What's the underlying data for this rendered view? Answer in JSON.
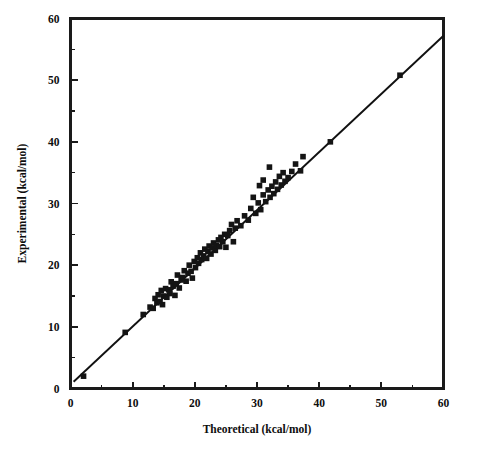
{
  "figure": {
    "background_color": "#ffffff",
    "foreground_color": "#111111",
    "width": 480,
    "height": 449
  },
  "axes": {
    "x_title": "Theoretical (kcal/mol)",
    "y_title": "Experimental (kcal/mol)",
    "x_ticks": [
      "0",
      "10",
      "20",
      "30",
      "40",
      "50",
      "60"
    ],
    "y_ticks": [
      "0",
      "10",
      "20",
      "30",
      "40",
      "50",
      "60"
    ],
    "x_tick_values": [
      0,
      10,
      20,
      30,
      40,
      50,
      60
    ],
    "y_tick_values": [
      0,
      10,
      20,
      30,
      40,
      50,
      60
    ],
    "x_minor_values": [
      5,
      15,
      25,
      35,
      45,
      55
    ],
    "y_minor_values": [
      5,
      15,
      25,
      35,
      45,
      55
    ]
  },
  "chart_data": {
    "type": "scatter",
    "title": "",
    "subtitle": "",
    "xlabel": "Theoretical (kcal/mol)",
    "ylabel": "Experimental (kcal/mol)",
    "xlim": [
      0,
      60
    ],
    "ylim": [
      0,
      60
    ],
    "grid": false,
    "legend": "none",
    "marker": {
      "shape": "square",
      "color": "#141414",
      "size_px": 5.6,
      "filled": true
    },
    "series": [
      {
        "name": "Theoretical vs Experimental",
        "points": [
          [
            2.1,
            2.0
          ],
          [
            8.8,
            9.1
          ],
          [
            11.7,
            12.0
          ],
          [
            12.8,
            13.2
          ],
          [
            13.3,
            13.0
          ],
          [
            13.6,
            14.6
          ],
          [
            13.9,
            13.9
          ],
          [
            14.1,
            15.2
          ],
          [
            14.4,
            14.1
          ],
          [
            14.6,
            15.9
          ],
          [
            14.8,
            13.6
          ],
          [
            15.0,
            15.0
          ],
          [
            15.3,
            16.2
          ],
          [
            15.5,
            14.8
          ],
          [
            15.8,
            16.0
          ],
          [
            16.0,
            15.4
          ],
          [
            16.2,
            17.3
          ],
          [
            16.5,
            16.6
          ],
          [
            16.8,
            15.1
          ],
          [
            17.0,
            17.0
          ],
          [
            17.2,
            18.4
          ],
          [
            17.5,
            16.3
          ],
          [
            17.8,
            17.6
          ],
          [
            18.0,
            18.0
          ],
          [
            18.3,
            19.1
          ],
          [
            18.6,
            17.4
          ],
          [
            18.9,
            18.7
          ],
          [
            19.1,
            20.0
          ],
          [
            19.4,
            19.0
          ],
          [
            19.6,
            17.9
          ],
          [
            19.9,
            20.6
          ],
          [
            20.1,
            19.6
          ],
          [
            20.4,
            21.2
          ],
          [
            20.6,
            20.3
          ],
          [
            20.9,
            22.0
          ],
          [
            21.1,
            20.9
          ],
          [
            21.4,
            21.5
          ],
          [
            21.6,
            22.6
          ],
          [
            21.9,
            21.1
          ],
          [
            22.1,
            22.2
          ],
          [
            22.3,
            23.1
          ],
          [
            22.6,
            21.8
          ],
          [
            22.8,
            22.8
          ],
          [
            23.0,
            23.6
          ],
          [
            23.3,
            22.4
          ],
          [
            23.5,
            23.2
          ],
          [
            23.8,
            24.1
          ],
          [
            24.0,
            23.0
          ],
          [
            24.2,
            24.5
          ],
          [
            24.5,
            23.8
          ],
          [
            24.8,
            25.0
          ],
          [
            25.0,
            22.9
          ],
          [
            25.3,
            24.8
          ],
          [
            25.6,
            25.6
          ],
          [
            25.9,
            26.6
          ],
          [
            26.2,
            23.8
          ],
          [
            26.5,
            26.0
          ],
          [
            26.8,
            27.2
          ],
          [
            27.4,
            26.4
          ],
          [
            28.0,
            28.0
          ],
          [
            28.6,
            27.3
          ],
          [
            29.0,
            29.2
          ],
          [
            29.4,
            31.0
          ],
          [
            29.8,
            28.4
          ],
          [
            30.2,
            30.1
          ],
          [
            30.6,
            29.0
          ],
          [
            31.0,
            31.4
          ],
          [
            31.4,
            30.3
          ],
          [
            31.8,
            32.2
          ],
          [
            32.1,
            31.0
          ],
          [
            32.4,
            32.8
          ],
          [
            32.7,
            31.6
          ],
          [
            33.0,
            33.5
          ],
          [
            33.3,
            32.3
          ],
          [
            33.6,
            34.4
          ],
          [
            33.9,
            33.0
          ],
          [
            34.2,
            35.0
          ],
          [
            34.5,
            33.6
          ],
          [
            32.0,
            35.9
          ],
          [
            31.0,
            33.8
          ],
          [
            30.4,
            32.9
          ],
          [
            35.0,
            34.2
          ],
          [
            35.6,
            35.2
          ],
          [
            36.2,
            36.4
          ],
          [
            37.0,
            35.3
          ],
          [
            37.4,
            37.6
          ],
          [
            41.8,
            40.0
          ],
          [
            53.0,
            50.8
          ]
        ]
      }
    ],
    "fit_line": {
      "name": "identity/regression line",
      "x_start": 0.5,
      "y_start": 1.1,
      "x_end": 60.0,
      "y_end": 57.2,
      "color": "#111111"
    }
  }
}
